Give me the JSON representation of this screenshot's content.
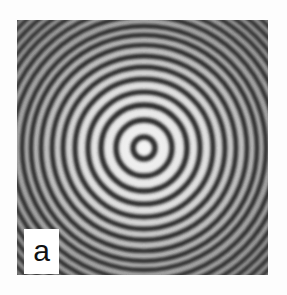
{
  "figure": {
    "panel_label": "a",
    "colors": {
      "dark_fringe": "#2a2a2a",
      "light_fringe": "#f2f2f2",
      "background": "#fdfdfd"
    },
    "center": {
      "x": 127,
      "y": 128
    },
    "ring_radii": [
      11,
      28,
      43,
      56,
      69,
      81,
      92,
      103,
      113,
      122,
      132,
      141,
      150,
      158,
      166,
      174,
      181
    ]
  }
}
